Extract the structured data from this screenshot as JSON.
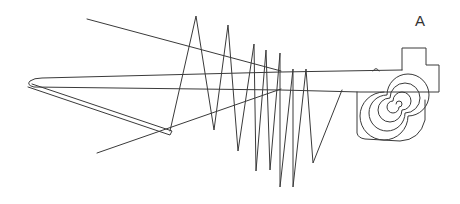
{
  "figure": {
    "label": "A",
    "colors": {
      "background": "#ffffff",
      "stroke": "#3a3a3a"
    }
  }
}
